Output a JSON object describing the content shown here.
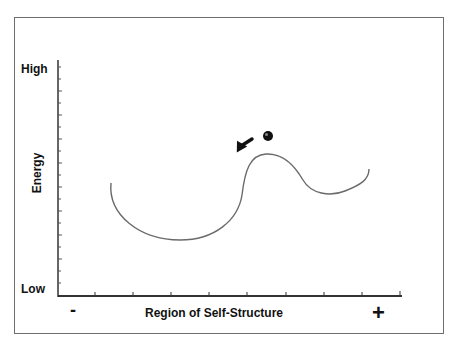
{
  "diagram": {
    "y_axis": {
      "title": "Energy",
      "top_label": "High",
      "bottom_label": "Low"
    },
    "x_axis": {
      "title": "Region of Self-Structure",
      "left_label": "-",
      "right_label": "+"
    },
    "elements": {
      "curve": "energy landscape with deep left well, central hill, shallow right well",
      "ball": "particle on top of the hill",
      "arrow": "arrow pointing down-left toward deep well"
    },
    "colors": {
      "frame": "#6e6e6e",
      "axis": "#333333",
      "curve": "#6a6a6a",
      "ball": "#111111"
    }
  }
}
